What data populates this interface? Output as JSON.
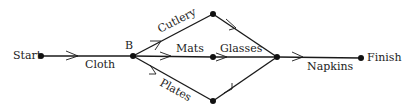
{
  "diagram": {
    "type": "activity-network",
    "nodes": {
      "start": {
        "label": "Start"
      },
      "b": {
        "label": "B"
      },
      "top": {
        "label": ""
      },
      "mid": {
        "label": ""
      },
      "bottom": {
        "label": ""
      },
      "merge": {
        "label": ""
      },
      "finish": {
        "label": "Finish"
      }
    },
    "edges": [
      {
        "from": "start",
        "to": "b",
        "label": "Cloth"
      },
      {
        "from": "b",
        "to": "top",
        "label": "Cutlery"
      },
      {
        "from": "b",
        "to": "mid",
        "label": "Mats"
      },
      {
        "from": "b",
        "to": "bottom",
        "label": "Plates"
      },
      {
        "from": "top",
        "to": "merge",
        "label": ""
      },
      {
        "from": "mid",
        "to": "merge",
        "label": "Glasses"
      },
      {
        "from": "bottom",
        "to": "merge",
        "label": ""
      },
      {
        "from": "merge",
        "to": "finish",
        "label": "Napkins"
      }
    ]
  }
}
